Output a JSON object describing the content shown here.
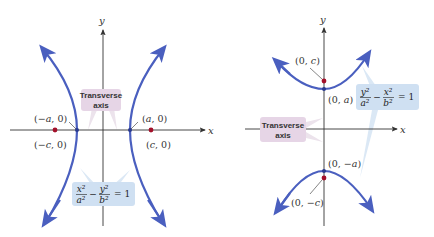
{
  "figures": [
    {
      "name": "horizontal-hyperbola",
      "axes": {
        "x_label": "x",
        "y_label": "y"
      },
      "points": {
        "left_vertex": "(−a, 0)",
        "right_vertex": "(a, 0)",
        "left_focus": "(−c, 0)",
        "right_focus": "(c, 0)"
      },
      "callout": {
        "line1": "Transverse",
        "line2": "axis"
      },
      "equation": {
        "term1_num": "x²",
        "term1_den": "a²",
        "minus": "−",
        "term2_num": "y²",
        "term2_den": "b²",
        "equals": "= 1"
      }
    },
    {
      "name": "vertical-hyperbola",
      "axes": {
        "x_label": "x",
        "y_label": "y"
      },
      "points": {
        "top_vertex": "(0, a)",
        "bottom_vertex": "(0, −a)",
        "top_focus": "(0, c)",
        "bottom_focus": "(0, −c)"
      },
      "callout": {
        "line1": "Transverse",
        "line2": "axis"
      },
      "equation": {
        "term1_num": "y²",
        "term1_den": "a²",
        "minus": "−",
        "term2_num": "x²",
        "term2_den": "b²",
        "equals": "= 1"
      }
    }
  ],
  "colors": {
    "curve": "#4a5fbf",
    "axis": "#333333",
    "focus": "#a3102a",
    "callout_pink": "#e6d5e6",
    "callout_blue": "#cfe0f2",
    "leader_pink": "#e9dfe9",
    "leader_blue": "#d6e6f5"
  }
}
